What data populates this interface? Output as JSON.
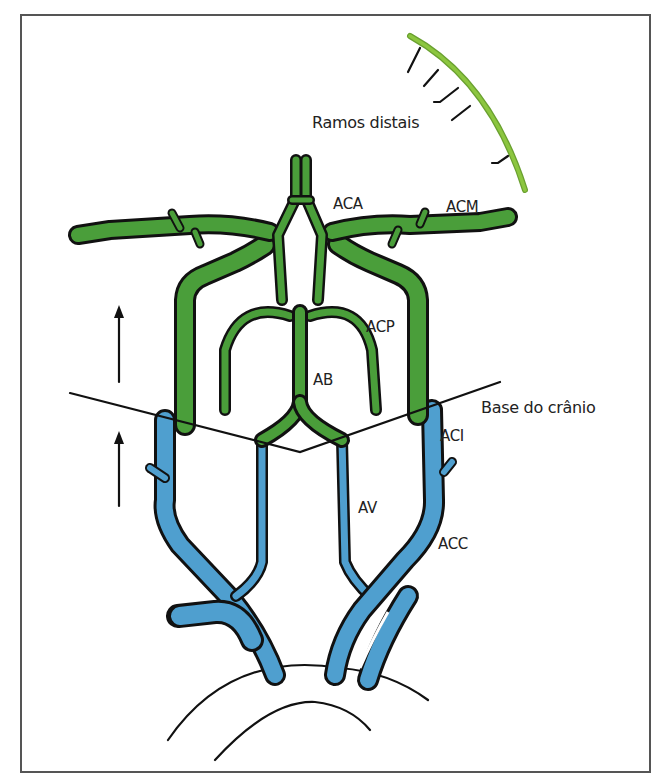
{
  "figure": {
    "type": "anatomical-diagram",
    "colors": {
      "intracranial": "#4a9e3a",
      "extracranial": "#4f9fcf",
      "distal_branches": "#8cc63f",
      "outline": "#111111",
      "frame": "#555555"
    }
  },
  "labels": {
    "distal": "Ramos distais",
    "aca": "ACA",
    "acm": "ACM",
    "acp": "ACP",
    "ab": "AB",
    "skull_base": "Base do crânio",
    "aci": "ACI",
    "av": "AV",
    "acc": "ACC"
  },
  "arrows": [
    {
      "direction": "up",
      "region": "intracranial"
    },
    {
      "direction": "up",
      "region": "extracranial"
    }
  ]
}
